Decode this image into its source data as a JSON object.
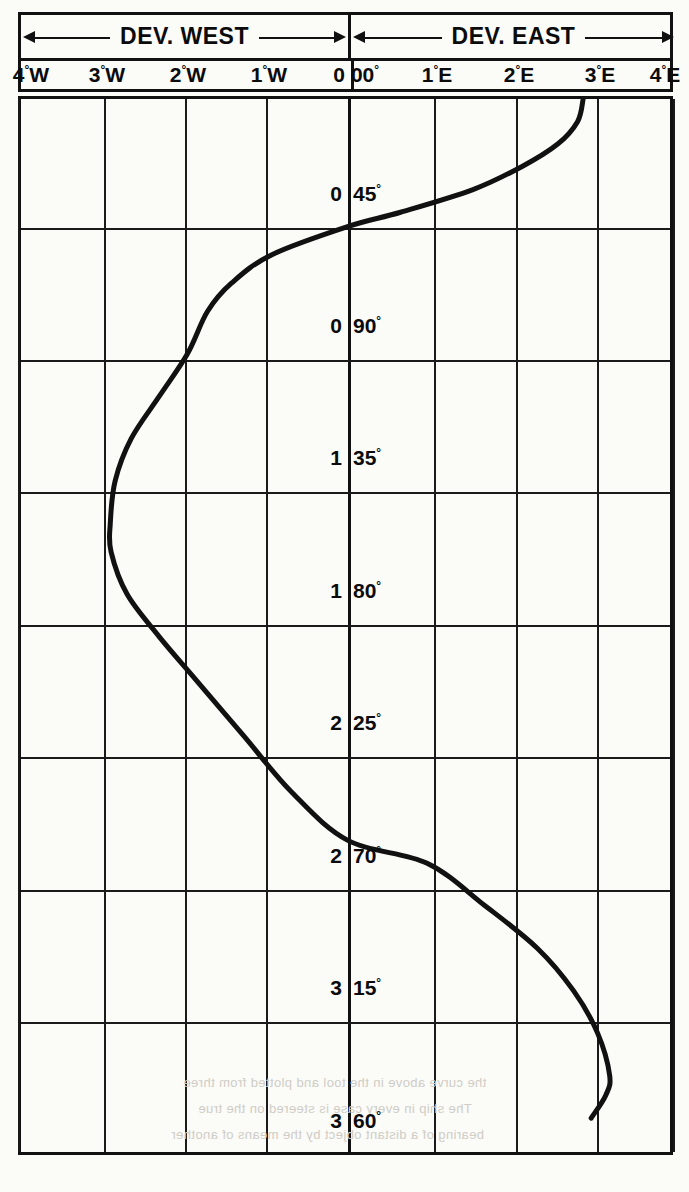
{
  "header": {
    "west_label": "DEV. WEST",
    "east_label": "DEV. EAST",
    "arrow_icon_left": "arrow-left-icon",
    "arrow_icon_right": "arrow-right-icon"
  },
  "x_axis": {
    "ticks": [
      {
        "label": "4°W",
        "value": -4,
        "px": 28
      },
      {
        "label": "3°W",
        "value": -3,
        "px": 104
      },
      {
        "label": "2°W",
        "value": -2,
        "px": 185
      },
      {
        "label": "1°W",
        "value": -1,
        "px": 266
      },
      {
        "label": "0",
        "value": 0,
        "px": 336
      },
      {
        "label": "00°",
        "value": 0,
        "px": 362
      },
      {
        "label": "1°E",
        "value": 1,
        "px": 434
      },
      {
        "label": "2°E",
        "value": 2,
        "px": 516
      },
      {
        "label": "3°E",
        "value": 3,
        "px": 597
      },
      {
        "label": "4°E",
        "value": 4,
        "px": 662
      }
    ],
    "gridlines_px": [
      18,
      104,
      185,
      266,
      348,
      434,
      516,
      597,
      673
    ],
    "center_px": 348
  },
  "y_axis": {
    "labels": [
      {
        "left": "0",
        "right": "45°",
        "value": 45,
        "px": 228
      },
      {
        "left": "0",
        "right": "90°",
        "value": 90,
        "px": 360
      },
      {
        "left": "1",
        "right": "35°",
        "value": 135,
        "px": 492
      },
      {
        "left": "1",
        "right": "80°",
        "value": 180,
        "px": 625
      },
      {
        "left": "2",
        "right": "25°",
        "value": 225,
        "px": 757
      },
      {
        "left": "2",
        "right": "70°",
        "value": 270,
        "px": 890
      },
      {
        "left": "3",
        "right": "15°",
        "value": 315,
        "px": 1022
      },
      {
        "left": "3",
        "right": "60°",
        "value": 360,
        "px": 1155
      }
    ],
    "gridlines_px": [
      228,
      360,
      492,
      625,
      757,
      890,
      1022
    ]
  },
  "bleed_text": [
    {
      "text": "the curve above in the tool and plotted from three",
      "x": 180,
      "y": 1072
    },
    {
      "text": "The ship in every case is steered on the true",
      "x": 195,
      "y": 1098
    },
    {
      "text": "bearing of a distant object by the means of another",
      "x": 168,
      "y": 1124
    }
  ],
  "chart_data": {
    "type": "line",
    "xlabel": "Deviation (degrees East / West)",
    "ylabel": "Compass heading (degrees)",
    "xlim": [
      -4.07,
      4.0
    ],
    "ylim": [
      0,
      372
    ],
    "grid": true,
    "legend": null,
    "x_unit": "degrees deviation",
    "y_unit": "degrees heading",
    "series": [
      {
        "name": "Deviation",
        "points": [
          {
            "heading": 0,
            "deviation": 2.92
          },
          {
            "heading": 8,
            "deviation": 2.85
          },
          {
            "heading": 16,
            "deviation": 2.6
          },
          {
            "heading": 24,
            "deviation": 2.15
          },
          {
            "heading": 32,
            "deviation": 1.55
          },
          {
            "heading": 40,
            "deviation": 0.65
          },
          {
            "heading": 45,
            "deviation": 0.0
          },
          {
            "heading": 55,
            "deviation": -0.95
          },
          {
            "heading": 65,
            "deviation": -1.45
          },
          {
            "heading": 75,
            "deviation": -1.75
          },
          {
            "heading": 90,
            "deviation": -2.0
          },
          {
            "heading": 105,
            "deviation": -2.35
          },
          {
            "heading": 120,
            "deviation": -2.7
          },
          {
            "heading": 135,
            "deviation": -2.9
          },
          {
            "heading": 150,
            "deviation": -2.96
          },
          {
            "heading": 160,
            "deviation": -2.95
          },
          {
            "heading": 175,
            "deviation": -2.75
          },
          {
            "heading": 190,
            "deviation": -2.35
          },
          {
            "heading": 205,
            "deviation": -1.9
          },
          {
            "heading": 225,
            "deviation": -1.3
          },
          {
            "heading": 245,
            "deviation": -0.7
          },
          {
            "heading": 262,
            "deviation": 0.0
          },
          {
            "heading": 270,
            "deviation": 0.98
          },
          {
            "heading": 285,
            "deviation": 1.7
          },
          {
            "heading": 300,
            "deviation": 2.35
          },
          {
            "heading": 315,
            "deviation": 2.8
          },
          {
            "heading": 330,
            "deviation": 3.1
          },
          {
            "heading": 345,
            "deviation": 3.25
          },
          {
            "heading": 352,
            "deviation": 3.2
          },
          {
            "heading": 360,
            "deviation": 3.02
          }
        ]
      }
    ],
    "annotations": [
      {
        "text": "DEV. WEST",
        "position": "top-left-half"
      },
      {
        "text": "DEV. EAST",
        "position": "top-right-half"
      }
    ]
  }
}
